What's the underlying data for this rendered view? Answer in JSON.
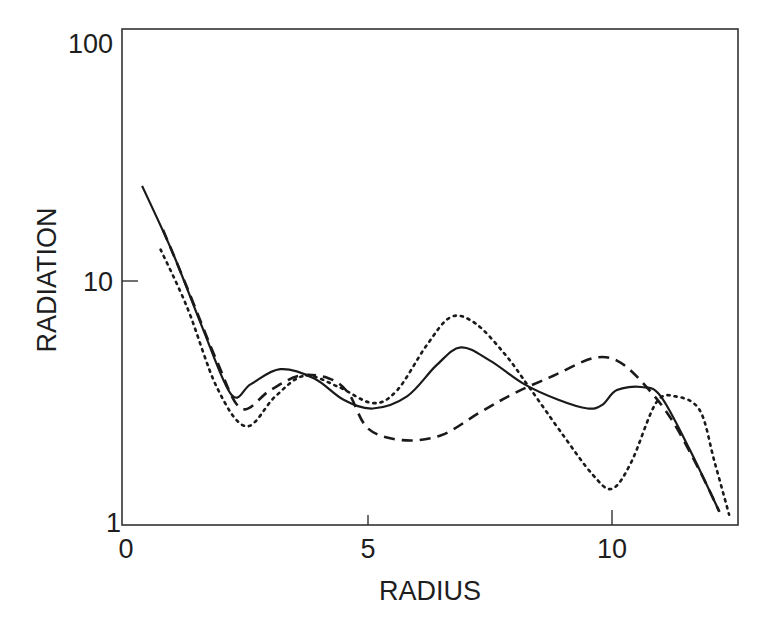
{
  "chart_data": {
    "type": "line",
    "title": "",
    "xlabel": "RADIUS",
    "ylabel": "RADIATION",
    "xlim": [
      0,
      12.6
    ],
    "ylim": [
      1,
      100
    ],
    "yscale": "log",
    "grid": false,
    "legend": "none",
    "x_ticks": [
      0,
      5,
      10
    ],
    "x_tick_labels": [
      "0",
      "5",
      "10"
    ],
    "y_ticks": [
      1,
      10,
      100
    ],
    "y_tick_labels": [
      "1",
      "10",
      "100"
    ],
    "series": [
      {
        "name": "solid",
        "style": "solid",
        "points": [
          [
            0.37,
            23.3
          ],
          [
            1.0,
            12.5
          ],
          [
            1.6,
            6.3
          ],
          [
            2.2,
            3.35
          ],
          [
            2.6,
            3.7
          ],
          [
            3.2,
            4.25
          ],
          [
            3.9,
            3.9
          ],
          [
            4.5,
            3.2
          ],
          [
            5.1,
            2.95
          ],
          [
            5.8,
            3.3
          ],
          [
            6.4,
            4.4
          ],
          [
            6.9,
            5.2
          ],
          [
            7.5,
            4.6
          ],
          [
            8.2,
            3.7
          ],
          [
            8.9,
            3.2
          ],
          [
            9.5,
            2.95
          ],
          [
            9.8,
            3.05
          ],
          [
            10.1,
            3.5
          ],
          [
            10.6,
            3.6
          ],
          [
            11.0,
            3.3
          ],
          [
            11.6,
            2.0
          ],
          [
            12.2,
            1.13
          ]
        ]
      },
      {
        "name": "dashed",
        "style": "dashed",
        "points": [
          [
            0.8,
            15.5
          ],
          [
            1.3,
            9.0
          ],
          [
            1.9,
            4.6
          ],
          [
            2.4,
            2.95
          ],
          [
            3.0,
            3.5
          ],
          [
            3.6,
            4.0
          ],
          [
            4.2,
            3.9
          ],
          [
            4.6,
            3.4
          ],
          [
            5.0,
            2.45
          ],
          [
            5.7,
            2.2
          ],
          [
            6.5,
            2.3
          ],
          [
            7.3,
            2.85
          ],
          [
            8.0,
            3.4
          ],
          [
            8.8,
            4.0
          ],
          [
            9.6,
            4.7
          ],
          [
            10.1,
            4.6
          ],
          [
            10.6,
            3.8
          ],
          [
            11.2,
            2.7
          ],
          [
            11.8,
            1.65
          ],
          [
            12.2,
            1.13
          ]
        ]
      },
      {
        "name": "dotted",
        "style": "dotted",
        "points": [
          [
            0.75,
            12.9
          ],
          [
            1.3,
            7.5
          ],
          [
            1.9,
            3.6
          ],
          [
            2.5,
            2.5
          ],
          [
            3.1,
            3.3
          ],
          [
            3.7,
            4.0
          ],
          [
            4.4,
            3.6
          ],
          [
            5.1,
            3.1
          ],
          [
            5.6,
            3.5
          ],
          [
            6.2,
            5.3
          ],
          [
            6.7,
            6.9
          ],
          [
            7.2,
            6.5
          ],
          [
            7.8,
            4.9
          ],
          [
            8.3,
            3.6
          ],
          [
            9.0,
            2.3
          ],
          [
            9.6,
            1.6
          ],
          [
            10.0,
            1.4
          ],
          [
            10.4,
            1.8
          ],
          [
            10.9,
            3.1
          ],
          [
            11.3,
            3.3
          ],
          [
            11.8,
            2.9
          ],
          [
            12.1,
            1.8
          ],
          [
            12.4,
            1.1
          ]
        ]
      }
    ]
  },
  "labels": {
    "x_axis_title": "RADIUS",
    "y_axis_title": "RADIATION",
    "x_tick_0": "0",
    "x_tick_5": "5",
    "x_tick_10": "10",
    "y_tick_1": "1",
    "y_tick_10": "10",
    "y_tick_100": "100"
  }
}
